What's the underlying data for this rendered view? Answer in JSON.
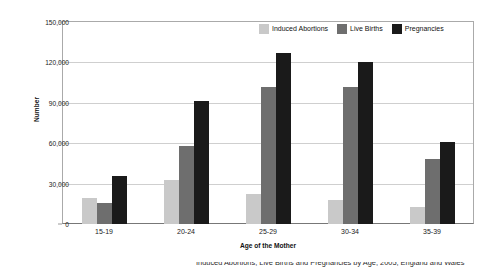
{
  "chart_data": {
    "type": "bar",
    "title": "",
    "xlabel": "Age of the Mother",
    "ylabel": "Number",
    "categories": [
      "15-19",
      "20-24",
      "25-29",
      "30-34",
      "35-39"
    ],
    "ylim": [
      0,
      150000
    ],
    "yticks": [
      0,
      30000,
      60000,
      90000,
      120000,
      150000
    ],
    "ytick_labels": [
      "0",
      "30,000",
      "60,000",
      "90,000",
      "120,000",
      "150,000"
    ],
    "grid": true,
    "legend_position": "top-right",
    "series": [
      {
        "name": "Induced Abortions",
        "color": "#c9c9c9",
        "values": [
          19000,
          32500,
          22500,
          17500,
          13000
        ]
      },
      {
        "name": "Live Births",
        "color": "#6e6e6e",
        "values": [
          15500,
          58000,
          101500,
          102000,
          48500
        ]
      },
      {
        "name": "Pregnancies",
        "color": "#1a1a1a",
        "values": [
          35500,
          91500,
          127000,
          120500,
          61000
        ]
      }
    ]
  },
  "caption": {
    "cut_off_line": "Induced Abortions, Live Births and Pregnancies by Age, 2005, England and Wales"
  }
}
